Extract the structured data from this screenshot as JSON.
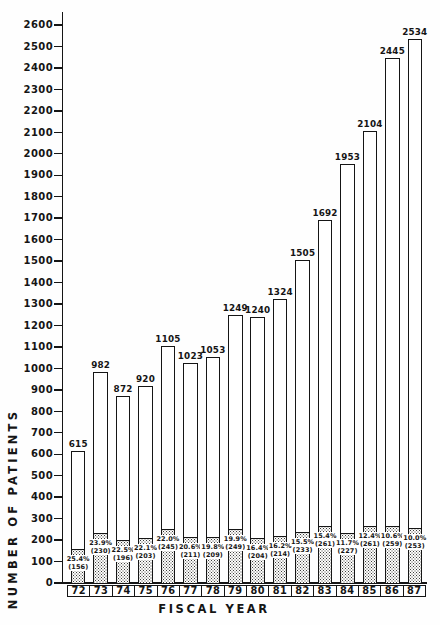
{
  "chart_data": {
    "type": "bar",
    "stacked": true,
    "xlabel": "FISCAL YEAR",
    "ylabel": "NUMBER OF PATIENTS",
    "ylim": [
      0,
      2600
    ],
    "ytick_step": 100,
    "grid": false,
    "legend": "none",
    "categories": [
      "72",
      "73",
      "74",
      "75",
      "76",
      "77",
      "78",
      "79",
      "80",
      "81",
      "82",
      "83",
      "84",
      "85",
      "86",
      "87"
    ],
    "series": [
      {
        "name": "stippled subgroup",
        "values": [
          156,
          230,
          196,
          203,
          245,
          211,
          209,
          249,
          204,
          214,
          233,
          261,
          227,
          261,
          259,
          253
        ]
      },
      {
        "name": "total patients",
        "values": [
          615,
          982,
          872,
          920,
          1105,
          1023,
          1053,
          1249,
          1240,
          1324,
          1505,
          1692,
          1953,
          2104,
          2445,
          2534
        ]
      }
    ],
    "bars": [
      {
        "year": "72",
        "total": 615,
        "pct": "25.4%",
        "count": 156
      },
      {
        "year": "73",
        "total": 982,
        "pct": "23.9%",
        "count": 230
      },
      {
        "year": "74",
        "total": 872,
        "pct": "22.5%",
        "count": 196
      },
      {
        "year": "75",
        "total": 920,
        "pct": "22.1%",
        "count": 203
      },
      {
        "year": "76",
        "total": 1105,
        "pct": "22.0%",
        "count": 245
      },
      {
        "year": "77",
        "total": 1023,
        "pct": "20.6%",
        "count": 211
      },
      {
        "year": "78",
        "total": 1053,
        "pct": "19.8%",
        "count": 209
      },
      {
        "year": "79",
        "total": 1249,
        "pct": "19.9%",
        "count": 249
      },
      {
        "year": "80",
        "total": 1240,
        "pct": "16.4%",
        "count": 204
      },
      {
        "year": "81",
        "total": 1324,
        "pct": "16.2%",
        "count": 214
      },
      {
        "year": "82",
        "total": 1505,
        "pct": "15.5%",
        "count": 233
      },
      {
        "year": "83",
        "total": 1692,
        "pct": "15.4%",
        "count": 261
      },
      {
        "year": "84",
        "total": 1953,
        "pct": "11.7%",
        "count": 227
      },
      {
        "year": "85",
        "total": 2104,
        "pct": "12.4%",
        "count": 261
      },
      {
        "year": "86",
        "total": 2445,
        "pct": "10.6%",
        "count": 259
      },
      {
        "year": "87",
        "total": 2534,
        "pct": "10.0%",
        "count": 253
      }
    ],
    "ink_color": "#151515",
    "background_color": "#fefefe"
  }
}
